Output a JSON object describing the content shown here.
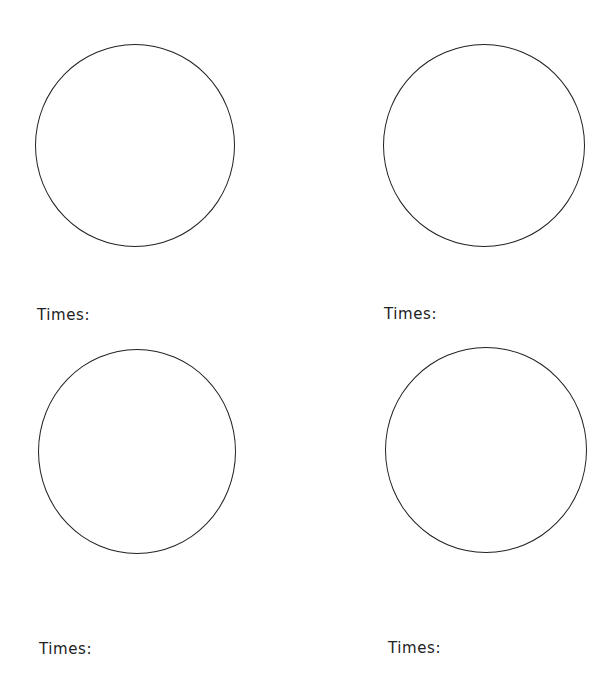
{
  "worksheet": {
    "cells": [
      {
        "id": "top-left",
        "label": "Times:",
        "circle": {
          "left": 35,
          "top": 44,
          "width": 200,
          "height": 203
        },
        "label_pos": {
          "left": 37,
          "top": 308
        }
      },
      {
        "id": "top-right",
        "label": "Times:",
        "circle": {
          "left": 383,
          "top": 44,
          "width": 202,
          "height": 203
        },
        "label_pos": {
          "left": 384,
          "top": 307
        }
      },
      {
        "id": "bottom-left",
        "label": "Times:",
        "circle": {
          "left": 38,
          "top": 349,
          "width": 198,
          "height": 205
        },
        "label_pos": {
          "left": 39,
          "top": 642
        }
      },
      {
        "id": "bottom-right",
        "label": "Times:",
        "circle": {
          "left": 385,
          "top": 347,
          "width": 202,
          "height": 206
        },
        "label_pos": {
          "left": 388,
          "top": 641
        }
      }
    ],
    "stroke_color": "#222222",
    "background_color": "#ffffff"
  }
}
